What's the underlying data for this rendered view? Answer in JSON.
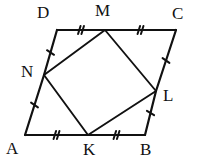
{
  "figure": {
    "kind": "geometry-diagram",
    "stroke_color": "#111111",
    "background_color": "#ffffff",
    "outer_polygon": {
      "name": "ABCD",
      "vertices": [
        "A",
        "B",
        "C",
        "D"
      ]
    },
    "inner_polygon": {
      "name": "KLMN",
      "vertices": [
        "K",
        "L",
        "M",
        "N"
      ]
    },
    "points": [
      {
        "id": "A",
        "label": "A",
        "x": 25,
        "y": 135,
        "label_x": 6,
        "label_y": 140
      },
      {
        "id": "B",
        "label": "B",
        "x": 145,
        "y": 135,
        "label_x": 140,
        "label_y": 141
      },
      {
        "id": "C",
        "label": "C",
        "x": 176,
        "y": 30,
        "label_x": 172,
        "label_y": 5
      },
      {
        "id": "D",
        "label": "D",
        "x": 57,
        "y": 30,
        "label_x": 37,
        "label_y": 4
      },
      {
        "id": "K",
        "label": "K",
        "x": 88,
        "y": 135,
        "label_x": 83,
        "label_y": 141
      },
      {
        "id": "L",
        "label": "L",
        "x": 156,
        "y": 91,
        "label_x": 163,
        "label_y": 87
      },
      {
        "id": "M",
        "label": "M",
        "x": 105,
        "y": 30,
        "label_x": 95,
        "label_y": 2
      },
      {
        "id": "N",
        "label": "N",
        "x": 44,
        "y": 75,
        "label_x": 21,
        "label_y": 63
      }
    ],
    "segments": [
      {
        "id": "DM",
        "from": "D",
        "to": "M",
        "ticks": 2,
        "kind": "outer-edge-half"
      },
      {
        "id": "MC",
        "from": "M",
        "to": "C",
        "ticks": 2,
        "kind": "outer-edge-half"
      },
      {
        "id": "AK",
        "from": "A",
        "to": "K",
        "ticks": 2,
        "kind": "outer-edge-half"
      },
      {
        "id": "KB",
        "from": "K",
        "to": "B",
        "ticks": 2,
        "kind": "outer-edge-half"
      },
      {
        "id": "DN",
        "from": "D",
        "to": "N",
        "ticks": 1,
        "kind": "outer-edge-half"
      },
      {
        "id": "NA",
        "from": "N",
        "to": "A",
        "ticks": 1,
        "kind": "outer-edge-half"
      },
      {
        "id": "CL",
        "from": "C",
        "to": "L",
        "ticks": 1,
        "kind": "outer-edge-half"
      },
      {
        "id": "LB",
        "from": "L",
        "to": "B",
        "ticks": 1,
        "kind": "outer-edge-half"
      },
      {
        "id": "NM",
        "from": "N",
        "to": "M",
        "ticks": 0,
        "kind": "inner-edge"
      },
      {
        "id": "ML",
        "from": "M",
        "to": "L",
        "ticks": 0,
        "kind": "inner-edge"
      },
      {
        "id": "LK",
        "from": "L",
        "to": "K",
        "ticks": 0,
        "kind": "inner-edge"
      },
      {
        "id": "KN",
        "from": "K",
        "to": "N",
        "ticks": 0,
        "kind": "inner-edge"
      }
    ]
  }
}
